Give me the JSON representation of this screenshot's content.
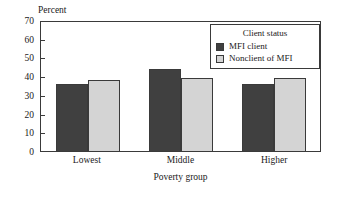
{
  "chart_data": {
    "type": "bar",
    "title": "",
    "subtitle": "",
    "xlabel": "Poverty group",
    "ylabel": "Percent",
    "categories": [
      "Lowest",
      "Middle",
      "Higher"
    ],
    "series": [
      {
        "name": "MFI client",
        "values": [
          36,
          44,
          36
        ],
        "color": "#404040"
      },
      {
        "name": "Nonclient of MFI",
        "values": [
          38,
          39,
          39
        ],
        "color": "#d4d4d4"
      }
    ],
    "ylim": [
      0,
      70
    ],
    "ytick_step": 10,
    "yticks": [
      70,
      60,
      50,
      40,
      30,
      20,
      10,
      0
    ],
    "grid": false,
    "legend": {
      "title": "Client status",
      "position": "top-right",
      "entries": [
        "MFI client",
        "Nonclient of MFI"
      ]
    }
  },
  "legend": {
    "title": "Client status",
    "items": [
      {
        "label": "MFI client"
      },
      {
        "label": "Nonclient of MFI"
      }
    ]
  },
  "axes": {
    "y_title": "Percent",
    "x_title": "Poverty group"
  },
  "colors": {
    "series_dark": "#404040",
    "series_light": "#d4d4d4",
    "frame": "#3a3a3a",
    "background": "#ffffff"
  }
}
